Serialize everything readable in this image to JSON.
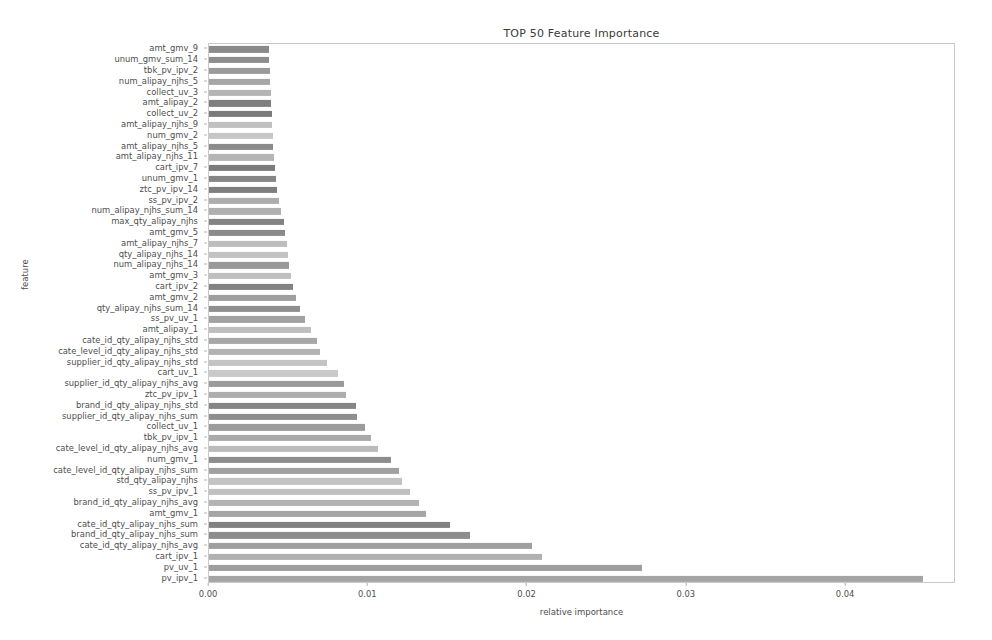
{
  "chart_data": {
    "type": "bar",
    "orientation": "horizontal",
    "title": "TOP 50 Feature Importance",
    "xlabel": "relative importance",
    "ylabel": "feature",
    "xlim": [
      0.0,
      0.0469
    ],
    "xticks": [
      0.0,
      0.01,
      0.02,
      0.03,
      0.04
    ],
    "xticklabels": [
      "0.00",
      "0.01",
      "0.02",
      "0.03",
      "0.04"
    ],
    "grid": false,
    "legend": null,
    "categories": [
      "amt_gmv_9",
      "unum_gmv_sum_14",
      "tbk_pv_ipv_2",
      "num_alipay_njhs_5",
      "collect_uv_3",
      "amt_alipay_2",
      "collect_uv_2",
      "amt_alipay_njhs_9",
      "num_gmv_2",
      "amt_alipay_njhs_5",
      "amt_alipay_njhs_11",
      "cart_ipv_7",
      "unum_gmv_1",
      "ztc_pv_ipv_14",
      "ss_pv_ipv_2",
      "num_alipay_njhs_sum_14",
      "max_qty_alipay_njhs",
      "amt_gmv_5",
      "amt_alipay_njhs_7",
      "qty_alipay_njhs_14",
      "num_alipay_njhs_14",
      "amt_gmv_3",
      "cart_ipv_2",
      "amt_gmv_2",
      "qty_alipay_njhs_sum_14",
      "ss_pv_uv_1",
      "amt_alipay_1",
      "cate_id_qty_alipay_njhs_std",
      "cate_level_id_qty_alipay_njhs_std",
      "supplier_id_qty_alipay_njhs_std",
      "cart_uv_1",
      "supplier_id_qty_alipay_njhs_avg",
      "ztc_pv_ipv_1",
      "brand_id_qty_alipay_njhs_std",
      "supplier_id_qty_alipay_njhs_sum",
      "collect_uv_1",
      "tbk_pv_ipv_1",
      "cate_level_id_qty_alipay_njhs_avg",
      "num_gmv_1",
      "cate_level_id_qty_alipay_njhs_sum",
      "std_qty_alipay_njhs",
      "ss_pv_ipv_1",
      "brand_id_qty_alipay_njhs_avg",
      "amt_gmv_1",
      "cate_id_qty_alipay_njhs_sum",
      "brand_id_qty_alipay_njhs_sum",
      "cate_id_qty_alipay_njhs_avg",
      "cart_ipv_1",
      "pv_uv_1",
      "pv_ipv_1"
    ],
    "values": [
      0.00375,
      0.00378,
      0.00381,
      0.00384,
      0.00387,
      0.0039,
      0.00393,
      0.00397,
      0.004,
      0.00404,
      0.00408,
      0.00412,
      0.0042,
      0.00428,
      0.0044,
      0.00455,
      0.00468,
      0.00478,
      0.00487,
      0.00494,
      0.005,
      0.00512,
      0.00525,
      0.00545,
      0.0057,
      0.006,
      0.0064,
      0.0068,
      0.007,
      0.0074,
      0.0081,
      0.00845,
      0.0086,
      0.0092,
      0.0093,
      0.0098,
      0.0102,
      0.0106,
      0.0114,
      0.0119,
      0.0121,
      0.0126,
      0.0132,
      0.0136,
      0.0151,
      0.0164,
      0.0203,
      0.0209,
      0.0272,
      0.0448
    ],
    "bar_colors": [
      "#8a8a8a",
      "#8d8d8d",
      "#9b9b9b",
      "#a6a6a6",
      "#b4b4b4",
      "#7f7f7f",
      "#7a7a7a",
      "#c0c0c0",
      "#c6c6c6",
      "#8b8b8b",
      "#b6b6b6",
      "#7c7c7c",
      "#868686",
      "#7e7e7e",
      "#adadad",
      "#b0b0b0",
      "#838383",
      "#8a8a8a",
      "#bdbdbd",
      "#c2c2c2",
      "#999999",
      "#bfbfbf",
      "#828282",
      "#9e9e9e",
      "#8f8f8f",
      "#a2a2a2",
      "#bebebe",
      "#a7a7a7",
      "#b2b2b2",
      "#c4c4c4",
      "#c9c9c9",
      "#9a9a9a",
      "#adadad",
      "#858585",
      "#8e8e8e",
      "#9c9c9c",
      "#a9a9a9",
      "#bbbbbb",
      "#8d8d8d",
      "#a0a0a0",
      "#c3c3c3",
      "#c0c0c0",
      "#b3b3b3",
      "#a5a5a5",
      "#818181",
      "#8c8c8c",
      "#9f9f9f",
      "#b1b1b1",
      "#9d9d9d",
      "#a4a4a4"
    ]
  },
  "figure": {
    "background": "#ffffff",
    "axes_border_color": "#c9c9c9",
    "tick_color": "#b0b0b0",
    "text_color": "#4d4d4d",
    "title_color": "#3a3a3a"
  }
}
